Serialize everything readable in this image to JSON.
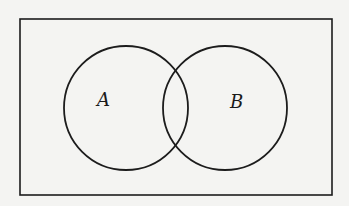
{
  "diagram": {
    "type": "venn",
    "background": "#f4f4f2",
    "stroke_color": "#1c1c1c",
    "universe": {
      "x": 20,
      "y": 19,
      "width": 312,
      "height": 176
    },
    "sets": [
      {
        "label": "A",
        "cx": 126,
        "cy": 108,
        "r": 62,
        "label_x": 97,
        "label_y": 106
      },
      {
        "label": "B",
        "cx": 225,
        "cy": 108,
        "r": 62,
        "label_x": 230,
        "label_y": 108
      }
    ]
  }
}
